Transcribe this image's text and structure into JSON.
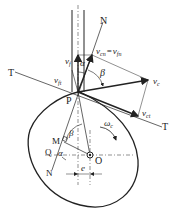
{
  "diagram": {
    "type": "cam-mechanism-velocity-diagram",
    "labels": {
      "normal_top": "N",
      "normal_bottom": "N",
      "tangent_left": "T",
      "tangent_right": "T",
      "contact_point": "P",
      "center": "O",
      "point_M": "M",
      "point_Q": "Q",
      "alpha_top": "α",
      "alpha_bottom": "α",
      "beta_top": "β",
      "beta_bottom": "β",
      "omega": "ωc",
      "omega_sub": "c",
      "eccentricity": "e",
      "v_f": "v",
      "v_f_sub": "f",
      "v_cn": "v",
      "v_cn_sub": "cn",
      "equals": "=",
      "v_fn": "v",
      "v_fn_sub": "fn",
      "v_c": "v",
      "v_c_sub": "c",
      "v_ft": "v",
      "v_ft_sub": "ft",
      "v_ct": "v",
      "v_ct_sub": "ct"
    },
    "colors": {
      "line": "#222222",
      "background": "#ffffff"
    }
  }
}
